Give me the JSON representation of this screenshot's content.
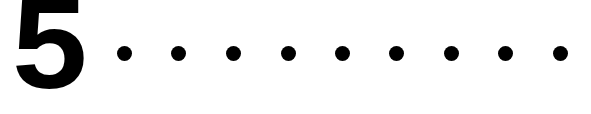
{
  "figure": {
    "name": "numeral-with-dot-leader",
    "width": 591,
    "height": 114,
    "background_color": "#ffffff",
    "ink_color": "#000000"
  },
  "number": {
    "text": "5",
    "color": "#000000",
    "left": 18,
    "top": 8,
    "right": 105,
    "bottom": 100,
    "cap_height": 92
  },
  "leader": {
    "dot_color": "#000000",
    "dot_diameter": 15,
    "dot_center_y": 53,
    "dot_spacing": 54.5,
    "dot_count": 9,
    "dots": [
      {
        "label": "dot-1",
        "cx": 124,
        "cy": 53,
        "d": 15
      },
      {
        "label": "dot-2",
        "cx": 178,
        "cy": 53,
        "d": 15
      },
      {
        "label": "dot-3",
        "cx": 233,
        "cy": 53,
        "d": 15
      },
      {
        "label": "dot-4",
        "cx": 288,
        "cy": 53,
        "d": 15
      },
      {
        "label": "dot-5",
        "cx": 342,
        "cy": 53,
        "d": 15
      },
      {
        "label": "dot-6",
        "cx": 396,
        "cy": 53,
        "d": 15
      },
      {
        "label": "dot-7",
        "cx": 451,
        "cy": 53,
        "d": 15
      },
      {
        "label": "dot-8",
        "cx": 505,
        "cy": 53,
        "d": 15
      },
      {
        "label": "dot-9",
        "cx": 560,
        "cy": 53,
        "d": 15
      }
    ]
  }
}
